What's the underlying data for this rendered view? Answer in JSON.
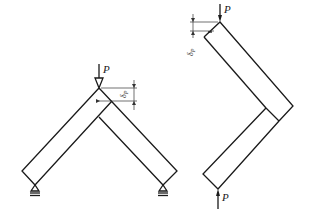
{
  "figures": [
    {
      "name": "v-frame-pinned",
      "load_label": "P",
      "displacement_label": "δP",
      "displacement_symbol": "δ",
      "displacement_subscript": "P",
      "supports": [
        "pin",
        "pin"
      ]
    },
    {
      "name": "v-frame-compressed",
      "top_load_label": "P",
      "bottom_load_label": "P",
      "displacement_label": "δP",
      "displacement_symbol": "δ",
      "displacement_subscript": "P"
    }
  ],
  "colors": {
    "line": "#1a1a1a",
    "background": "#ffffff"
  }
}
